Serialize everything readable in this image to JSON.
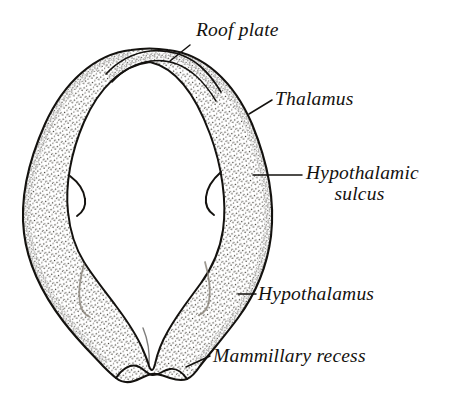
{
  "figure": {
    "kind": "anatomical-line-drawing",
    "background_color": "#ffffff",
    "ink_color": "#14120f",
    "stipple_color": "#3a362f",
    "cavity_color": "#ffffff"
  },
  "labels": {
    "roof_plate": "Roof plate",
    "thalamus": "Thalamus",
    "hypothalamic_sulcus_line1": "Hypothalamic",
    "hypothalamic_sulcus_line2": "sulcus",
    "hypothalamus": "Hypothalamus",
    "mammillary_recess": "Mammillary recess"
  },
  "structures": [
    {
      "name": "roof-plate",
      "description": "Thin membranous band forming the dome apex of the section",
      "label": "Roof plate"
    },
    {
      "name": "thalamus",
      "description": "Upper stippled lateral wall region above the hypothalamic sulcus",
      "label": "Thalamus"
    },
    {
      "name": "hypothalamic-sulcus",
      "description": "Notch indenting the ventricular surface separating thalamus from hypothalamus",
      "label": "Hypothalamic sulcus"
    },
    {
      "name": "hypothalamus",
      "description": "Lower stippled lateral wall lobes converging toward the midline floor",
      "label": "Hypothalamus"
    },
    {
      "name": "mammillary-recess",
      "description": "Small midline outpouching at the inferior margin of the floor",
      "label": "Mammillary recess"
    },
    {
      "name": "third-ventricle-cavity",
      "description": "Unshaded cleft-shaped cavity enclosed by the walls",
      "label": ""
    }
  ],
  "leader_lines": [
    {
      "name": "leader-roof-plate",
      "from_label": "Roof plate",
      "to_structure": "roof-plate"
    },
    {
      "name": "leader-thalamus",
      "from_label": "Thalamus",
      "to_structure": "thalamus"
    },
    {
      "name": "leader-hypothalamic-sulcus",
      "from_label": "Hypothalamic sulcus",
      "to_structure": "hypothalamic-sulcus"
    },
    {
      "name": "leader-hypothalamus",
      "from_label": "Hypothalamus",
      "to_structure": "hypothalamus"
    },
    {
      "name": "leader-mammillary-recess",
      "from_label": "Mammillary recess",
      "to_structure": "mammillary-recess"
    }
  ]
}
